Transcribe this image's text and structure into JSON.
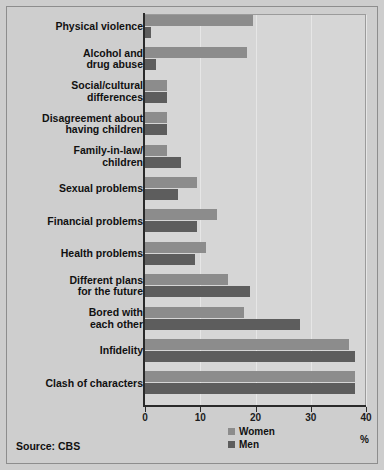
{
  "figure": {
    "source_note": "Source: CBS",
    "unit_label": "%"
  },
  "legend": {
    "position": "bottom-center",
    "entries": [
      {
        "label": "Women",
        "color": "#8c8c8c"
      },
      {
        "label": "Men",
        "color": "#5d5d5d"
      }
    ]
  },
  "colors": {
    "background": "#cecece",
    "plot_background": "#d6d6d6",
    "gridline": "#e6e6e6",
    "axis": "#2a2a2a",
    "women": "#8c8c8c",
    "men": "#5d5d5d"
  },
  "chart_data": {
    "type": "bar",
    "orientation": "horizontal",
    "title": "",
    "subtitle": "",
    "xlabel": "%",
    "ylabel": "",
    "xlim": [
      0,
      40
    ],
    "xticks": [
      0,
      10,
      20,
      30,
      40
    ],
    "xtick_labels": [
      "0",
      "10",
      "20",
      "30",
      "40"
    ],
    "grid": true,
    "grid_axis": "x",
    "legend": [
      "Women",
      "Men"
    ],
    "categories": [
      "Physical violence",
      "Alcohol and\ndrug abuse",
      "Social/cultural\ndifferences",
      "Disagreement about\nhaving children",
      "Family-in-law/\nchildren",
      "Sexual problems",
      "Financial problems",
      "Health problems",
      "Different plans\nfor the future",
      "Bored with\neach other",
      "Infidelity",
      "Clash of characters"
    ],
    "series": [
      {
        "name": "Women",
        "color": "#8c8c8c",
        "values": [
          19.5,
          18.5,
          4,
          4,
          4,
          9.5,
          13,
          11,
          15,
          18,
          37,
          38
        ]
      },
      {
        "name": "Men",
        "color": "#5d5d5d",
        "values": [
          1,
          2,
          4,
          4,
          6.5,
          6,
          9.5,
          9,
          19,
          28,
          38,
          38
        ]
      }
    ]
  }
}
